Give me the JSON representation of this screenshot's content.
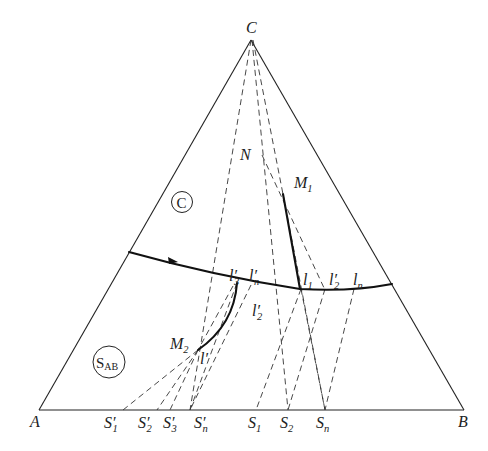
{
  "diagram": {
    "type": "ternary-phase-diagram",
    "vertices": {
      "A": {
        "label": "A",
        "x": 39,
        "y": 410
      },
      "B": {
        "label": "B",
        "x": 464,
        "y": 410
      },
      "C": {
        "label": "C",
        "x": 251,
        "y": 40
      }
    },
    "phase_regions": {
      "primary_C": {
        "label": "C",
        "circled": true
      },
      "solid_solution": {
        "label": "S",
        "sub": "AB",
        "circled": true
      }
    },
    "boundary_curve": {
      "description": "univariant boundary line with arrow showing falling temperature",
      "arrow_direction": "right"
    },
    "points": {
      "N": {
        "label": "N"
      },
      "M1": {
        "label": "M",
        "sub": "1"
      },
      "M2": {
        "label": "M",
        "sub": "2"
      },
      "l1": {
        "label": "l",
        "sub": "1"
      },
      "l2p": {
        "label": "l′",
        "sub": "2"
      },
      "ln": {
        "label": "l",
        "sub": "n"
      },
      "l3p": {
        "label": "l′",
        "sub": "3"
      },
      "lnp": {
        "label": "l′",
        "sub": "n"
      },
      "l2p_lower": {
        "label": "l′",
        "sub": "2"
      },
      "lp": {
        "label": "l′"
      }
    },
    "base_points": [
      {
        "label": "S′",
        "sub": "1"
      },
      {
        "label": "S′",
        "sub": "2"
      },
      {
        "label": "S′",
        "sub": "3"
      },
      {
        "label": "S′",
        "sub": "n"
      },
      {
        "label": "S",
        "sub": "1"
      },
      {
        "label": "S",
        "sub": "2"
      },
      {
        "label": "S",
        "sub": "n"
      }
    ]
  }
}
